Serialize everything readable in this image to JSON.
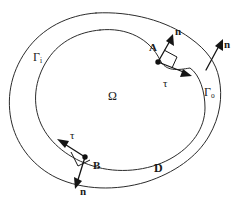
{
  "figure": {
    "type": "math-domain-diagram",
    "background_color": "#ffffff",
    "stroke_color": "#2b2b2b",
    "vector_color": "#151515"
  },
  "regions": {
    "inner_region_label": "Ω",
    "annulus_label": "D"
  },
  "boundaries": {
    "inner": {
      "name": "inner-boundary-curve",
      "label_base": "Γ",
      "label_subscript": "i"
    },
    "outer": {
      "name": "outer-boundary-curve",
      "label_base": "Γ",
      "label_subscript": "o"
    }
  },
  "points": [
    {
      "id": "A",
      "label": "A",
      "on": "inner-boundary-curve"
    },
    {
      "id": "B",
      "label": "B",
      "on": "inner-boundary-curve"
    }
  ],
  "vectors": [
    {
      "id": "n-at-A",
      "label": "n",
      "kind": "normal",
      "at_point": "A"
    },
    {
      "id": "tau-at-A",
      "label": "τ",
      "kind": "tangent",
      "at_point": "A"
    },
    {
      "id": "n-on-outer",
      "label": "n",
      "kind": "normal",
      "at_point": "outer-boundary-curve"
    },
    {
      "id": "n-at-B",
      "label": "n",
      "kind": "normal",
      "at_point": "B"
    },
    {
      "id": "tau-at-B",
      "label": "τ",
      "kind": "tangent",
      "at_point": "B"
    }
  ]
}
